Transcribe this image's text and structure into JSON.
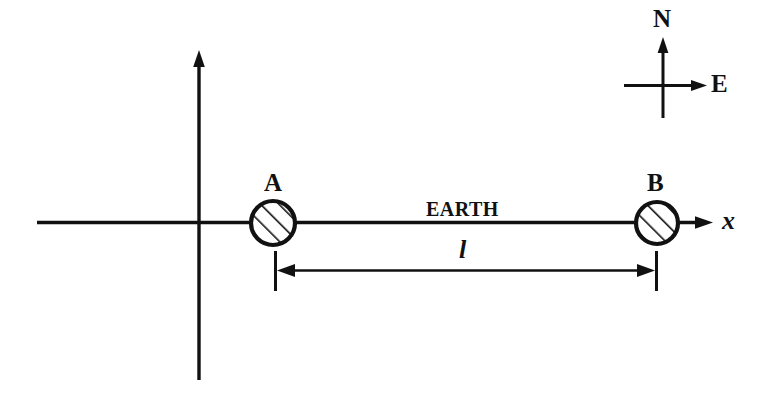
{
  "figure": {
    "kind": "physics-schematic-diagram",
    "background_color": "#ffffff",
    "stroke_color": "#111111",
    "width": 764,
    "height": 404
  },
  "axes": {
    "x_axis_label": "x",
    "y_axis_label": ""
  },
  "bodies": [
    {
      "id": "A",
      "label": "A",
      "cx": 273,
      "cy": 223,
      "r": 22,
      "fill_pattern": "diagonal-hatch"
    },
    {
      "id": "B",
      "label": "B",
      "cx": 657,
      "cy": 223,
      "r": 21,
      "fill_pattern": "diagonal-hatch"
    }
  ],
  "annotations": {
    "medium_label": "EARTH",
    "distance_label": "l"
  },
  "compass": {
    "north_label": "N",
    "east_label": "E"
  }
}
